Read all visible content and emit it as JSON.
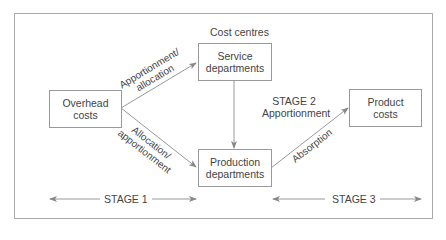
{
  "diagram": {
    "header_label": "Cost centres",
    "nodes": {
      "overhead": {
        "line1": "Overhead",
        "line2": "costs"
      },
      "service": {
        "line1": "Service",
        "line2": "departments"
      },
      "production": {
        "line1": "Production",
        "line2": "departments"
      },
      "product": {
        "line1": "Product",
        "line2": "costs"
      }
    },
    "edges": {
      "overhead_to_service": {
        "line1": "Apportionment/",
        "line2": "allocation"
      },
      "overhead_to_production": {
        "line1": "Allocation/",
        "line2": "apportionment"
      },
      "service_to_production": {
        "line1": "STAGE 2",
        "line2": "Apportionment"
      },
      "production_to_product": {
        "line1": "Absorption"
      }
    },
    "stages": {
      "stage1": "STAGE 1",
      "stage3": "STAGE 3"
    },
    "colors": {
      "line": "#888888",
      "border": "#999999",
      "text": "#444444"
    }
  }
}
